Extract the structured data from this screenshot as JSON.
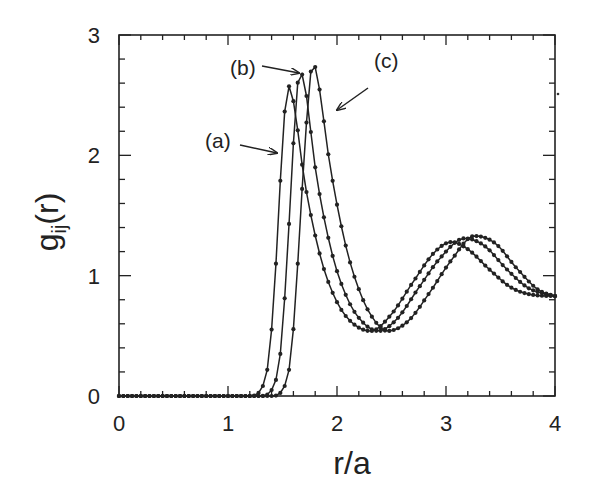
{
  "chart_data": {
    "type": "line",
    "title": "",
    "xlabel": "r/a",
    "ylabel": "g_ij(r)",
    "xlim": [
      0,
      4
    ],
    "ylim": [
      0,
      3
    ],
    "x_ticks": [
      "0",
      "1",
      "2",
      "3",
      "4"
    ],
    "y_ticks": [
      "0",
      "1",
      "2",
      "3"
    ],
    "grid": false,
    "legend": "none (inline annotations with arrows)",
    "marker": "small filled circles",
    "line_color": "#222222",
    "series": [
      {
        "name": "(a)",
        "keypoints": [
          [
            0,
            0
          ],
          [
            1.2,
            0
          ],
          [
            1.3,
            0.05
          ],
          [
            1.38,
            0.35
          ],
          [
            1.44,
            1.1
          ],
          [
            1.5,
            2.1
          ],
          [
            1.55,
            2.58
          ],
          [
            1.6,
            2.45
          ],
          [
            1.7,
            1.8
          ],
          [
            1.85,
            1.15
          ],
          [
            2.0,
            0.78
          ],
          [
            2.15,
            0.6
          ],
          [
            2.31,
            0.54
          ],
          [
            2.5,
            0.68
          ],
          [
            2.7,
            0.95
          ],
          [
            2.9,
            1.2
          ],
          [
            3.05,
            1.28
          ],
          [
            3.2,
            1.22
          ],
          [
            3.4,
            1.05
          ],
          [
            3.6,
            0.9
          ],
          [
            3.8,
            0.84
          ],
          [
            4.0,
            0.83
          ]
        ]
      },
      {
        "name": "(b)",
        "keypoints": [
          [
            0,
            0
          ],
          [
            1.3,
            0
          ],
          [
            1.4,
            0.05
          ],
          [
            1.48,
            0.35
          ],
          [
            1.54,
            1.1
          ],
          [
            1.6,
            2.1
          ],
          [
            1.66,
            2.7
          ],
          [
            1.71,
            2.55
          ],
          [
            1.8,
            1.9
          ],
          [
            1.95,
            1.2
          ],
          [
            2.1,
            0.8
          ],
          [
            2.25,
            0.6
          ],
          [
            2.38,
            0.54
          ],
          [
            2.55,
            0.64
          ],
          [
            2.75,
            0.9
          ],
          [
            2.95,
            1.15
          ],
          [
            3.17,
            1.31
          ],
          [
            3.35,
            1.25
          ],
          [
            3.55,
            1.06
          ],
          [
            3.75,
            0.9
          ],
          [
            3.9,
            0.85
          ],
          [
            4.0,
            0.83
          ]
        ]
      },
      {
        "name": "(c)",
        "keypoints": [
          [
            0,
            0
          ],
          [
            1.4,
            0
          ],
          [
            1.5,
            0.05
          ],
          [
            1.58,
            0.35
          ],
          [
            1.64,
            1.1
          ],
          [
            1.71,
            2.15
          ],
          [
            1.78,
            2.77
          ],
          [
            1.83,
            2.6
          ],
          [
            1.93,
            1.95
          ],
          [
            2.08,
            1.25
          ],
          [
            2.22,
            0.84
          ],
          [
            2.35,
            0.62
          ],
          [
            2.46,
            0.54
          ],
          [
            2.65,
            0.62
          ],
          [
            2.85,
            0.86
          ],
          [
            3.05,
            1.13
          ],
          [
            3.26,
            1.33
          ],
          [
            3.45,
            1.27
          ],
          [
            3.65,
            1.06
          ],
          [
            3.85,
            0.88
          ],
          [
            4.0,
            0.83
          ]
        ]
      }
    ],
    "annotations": [
      {
        "label": "(a)",
        "text_xy": [
          205,
          148
        ],
        "arrow_from": [
          240,
          145
        ],
        "arrow_to": [
          277,
          153
        ]
      },
      {
        "label": "(b)",
        "text_xy": [
          230,
          75
        ],
        "arrow_from": [
          262,
          66
        ],
        "arrow_to": [
          299,
          73
        ]
      },
      {
        "label": "(c)",
        "text_xy": [
          374,
          68
        ],
        "arrow_from": [
          368,
          88
        ],
        "arrow_to": [
          337,
          110
        ]
      }
    ]
  }
}
